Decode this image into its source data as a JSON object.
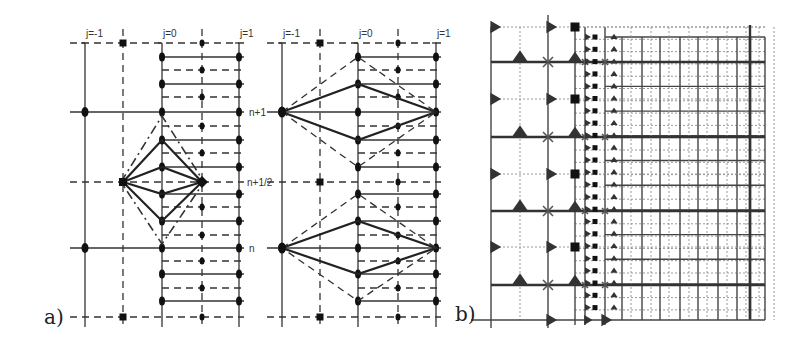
{
  "figure": {
    "panel_a": {
      "label": "a)",
      "left_stencil": {
        "column_labels": [
          "j=-1",
          "j=0",
          "j=1"
        ],
        "column_x": [
          85,
          162,
          239
        ],
        "half_column_x": [
          123,
          202
        ],
        "row_labels": {
          "n_plus_1": "n+1",
          "n_plus_half": "n+1/2",
          "n": "n"
        }
      },
      "right_stencil": {
        "column_labels": [
          "j=-1",
          "j=0",
          "j=1"
        ],
        "column_x": [
          282,
          358,
          436
        ],
        "half_column_x": [
          320,
          398
        ]
      },
      "rows": {
        "top_dashed_y": 43,
        "n_plus_1_y": 112,
        "n_plus_half_y": 182,
        "n_y": 248,
        "bottom_dashed_y": 317,
        "fine_solid_y": [
          57,
          84,
          140,
          167,
          194,
          221,
          274,
          301
        ],
        "fine_dashed_y": [
          70,
          97,
          126,
          153,
          207,
          235,
          261,
          288
        ]
      }
    },
    "panel_b": {
      "label": "b)",
      "coarse_columns_x": [
        491,
        548
      ],
      "coarse_dotted_columns_x": [
        520
      ],
      "mid_columns_x": [
        575,
        585,
        605
      ],
      "fine_columns_x": [
        622,
        642,
        660,
        680,
        698,
        718,
        737,
        750,
        765
      ],
      "solid_rows_y": [
        62,
        137,
        211,
        285
      ],
      "dotted_rows_y": [
        27,
        99,
        174,
        247
      ],
      "bottom_y": 320
    },
    "colors": {
      "ink": "#333333",
      "grid_light": "#999999",
      "background": "#ffffff"
    }
  }
}
